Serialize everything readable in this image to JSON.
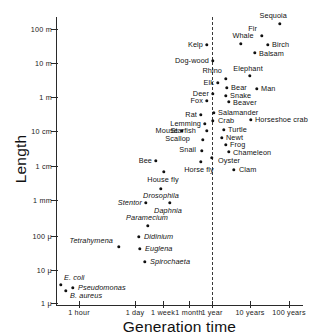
{
  "chart_data": {
    "type": "scatter",
    "title": "",
    "xlabel": "Generation time",
    "ylabel": "Length",
    "xticks": [
      "1 hour",
      "1 day",
      "1 week",
      "1 month",
      "1 year",
      "10 years",
      "100 years"
    ],
    "yticks": [
      "100 m",
      "10 m",
      "1 m",
      "10 cm",
      "1 cm",
      "1 mm",
      "100 μ",
      "10 μ",
      "1 μ"
    ],
    "grid": false,
    "legend": "none",
    "annotations": [
      {
        "name": "one-year-divider",
        "type": "vertical-dashed-line",
        "x": "1 year"
      }
    ],
    "points": [
      {
        "label": "Sequoia",
        "x": 280,
        "y": 24,
        "lx": 287,
        "ly": 16,
        "align": "r",
        "italic": false
      },
      {
        "label": "Fir",
        "x": 262,
        "y": 36,
        "lx": 257,
        "ly": 29,
        "align": "r",
        "italic": false
      },
      {
        "label": "Whale",
        "x": 241,
        "y": 44,
        "lx": 243,
        "ly": 36,
        "align": "c",
        "italic": false
      },
      {
        "label": "Birch",
        "x": 268,
        "y": 45,
        "lx": 272,
        "ly": 45,
        "align": "l",
        "italic": false
      },
      {
        "label": "Kelp",
        "x": 207,
        "y": 45,
        "lx": 203,
        "ly": 45,
        "align": "r",
        "italic": false
      },
      {
        "label": "Balsam",
        "x": 255,
        "y": 53,
        "lx": 259,
        "ly": 54,
        "align": "l",
        "italic": false
      },
      {
        "label": "Dog-wood",
        "x": 213,
        "y": 61,
        "lx": 209,
        "ly": 61,
        "align": "r",
        "italic": false
      },
      {
        "label": "Elephant",
        "x": 250,
        "y": 76,
        "lx": 248,
        "ly": 69,
        "align": "c",
        "italic": false
      },
      {
        "label": "Rhino",
        "x": 226,
        "y": 79,
        "lx": 222,
        "ly": 71,
        "align": "r",
        "italic": false
      },
      {
        "label": "Elk",
        "x": 218,
        "y": 83,
        "lx": 214,
        "ly": 83,
        "align": "r",
        "italic": false
      },
      {
        "label": "Bear",
        "x": 227,
        "y": 88,
        "lx": 231,
        "ly": 88,
        "align": "l",
        "italic": false
      },
      {
        "label": "Man",
        "x": 257,
        "y": 89,
        "lx": 261,
        "ly": 89,
        "align": "l",
        "italic": false
      },
      {
        "label": "Deer",
        "x": 213,
        "y": 94,
        "lx": 209,
        "ly": 94,
        "align": "r",
        "italic": false
      },
      {
        "label": "Snake",
        "x": 226,
        "y": 96,
        "lx": 230,
        "ly": 96,
        "align": "l",
        "italic": false
      },
      {
        "label": "Fox",
        "x": 207,
        "y": 101,
        "lx": 203,
        "ly": 101,
        "align": "r",
        "italic": false
      },
      {
        "label": "Beaver",
        "x": 229,
        "y": 102,
        "lx": 233,
        "ly": 103,
        "align": "l",
        "italic": false
      },
      {
        "label": "Salamander",
        "x": 214,
        "y": 113,
        "lx": 218,
        "ly": 113,
        "align": "l",
        "italic": false
      },
      {
        "label": "Rat",
        "x": 201,
        "y": 115,
        "lx": 197,
        "ly": 115,
        "align": "r",
        "italic": false
      },
      {
        "label": "Crab",
        "x": 213,
        "y": 121,
        "lx": 218,
        "ly": 121,
        "align": "l",
        "italic": false
      },
      {
        "label": "Horseshoe crab",
        "x": 251,
        "y": 120,
        "lx": 255,
        "ly": 120,
        "align": "l",
        "italic": false
      },
      {
        "label": "Lemming",
        "x": 205,
        "y": 124,
        "lx": 201,
        "ly": 124,
        "align": "r",
        "italic": false
      },
      {
        "label": "Starfish",
        "x": 207,
        "y": 131,
        "lx": 196,
        "ly": 131,
        "align": "r",
        "italic": false
      },
      {
        "label": "Mouse",
        "x": 182,
        "y": 131,
        "lx": 178,
        "ly": 131,
        "align": "r",
        "italic": false
      },
      {
        "label": "Turtle",
        "x": 224,
        "y": 130,
        "lx": 228,
        "ly": 130,
        "align": "l",
        "italic": false
      },
      {
        "label": "Newt",
        "x": 222,
        "y": 138,
        "lx": 226,
        "ly": 138,
        "align": "l",
        "italic": false
      },
      {
        "label": "Scallop",
        "x": 203,
        "y": 140,
        "lx": 190,
        "ly": 139,
        "align": "r",
        "italic": false
      },
      {
        "label": "Frog",
        "x": 226,
        "y": 145,
        "lx": 230,
        "ly": 145,
        "align": "l",
        "italic": false
      },
      {
        "label": "Snail",
        "x": 202,
        "y": 151,
        "lx": 196,
        "ly": 150,
        "align": "r",
        "italic": false
      },
      {
        "label": "Chameleon",
        "x": 229,
        "y": 152,
        "lx": 233,
        "ly": 153,
        "align": "l",
        "italic": false
      },
      {
        "label": "Oyster",
        "x": 212,
        "y": 158,
        "lx": 218,
        "ly": 161,
        "align": "l",
        "italic": false
      },
      {
        "label": "Bee",
        "x": 156,
        "y": 161,
        "lx": 152,
        "ly": 161,
        "align": "r",
        "italic": false
      },
      {
        "label": "Horse fly",
        "x": 201,
        "y": 162,
        "lx": 199,
        "ly": 170,
        "align": "c",
        "italic": false
      },
      {
        "label": "Clam",
        "x": 234,
        "y": 170,
        "lx": 239,
        "ly": 170,
        "align": "l",
        "italic": false
      },
      {
        "label": "House fly",
        "x": 164,
        "y": 172,
        "lx": 163,
        "ly": 180,
        "align": "c",
        "italic": false
      },
      {
        "label": "Drosophila",
        "x": 161,
        "y": 189,
        "lx": 161,
        "ly": 196,
        "align": "c",
        "italic": true
      },
      {
        "label": "Daphnia",
        "x": 170,
        "y": 203,
        "lx": 168,
        "ly": 211,
        "align": "c",
        "italic": true
      },
      {
        "label": "Stentor",
        "x": 146,
        "y": 203,
        "lx": 142,
        "ly": 203,
        "align": "r",
        "italic": true
      },
      {
        "label": "Paramecium",
        "x": 148,
        "y": 226,
        "lx": 147,
        "ly": 218,
        "align": "c",
        "italic": true
      },
      {
        "label": "Didinium",
        "x": 139,
        "y": 237,
        "lx": 144,
        "ly": 237,
        "align": "l",
        "italic": true
      },
      {
        "label": "Tetrahymena",
        "x": 119,
        "y": 247,
        "lx": 113,
        "ly": 241,
        "align": "r",
        "italic": true
      },
      {
        "label": "Euglena",
        "x": 140,
        "y": 249,
        "lx": 145,
        "ly": 249,
        "align": "l",
        "italic": true
      },
      {
        "label": "Spirochaeta",
        "x": 145,
        "y": 262,
        "lx": 150,
        "ly": 262,
        "align": "l",
        "italic": true
      },
      {
        "label": "E. coli",
        "x": 61,
        "y": 285,
        "lx": 64,
        "ly": 278,
        "align": "l",
        "italic": true
      },
      {
        "label": "Pseudomonas",
        "x": 73,
        "y": 288,
        "lx": 78,
        "ly": 288,
        "align": "l",
        "italic": true
      },
      {
        "label": "B. aureus",
        "x": 66,
        "y": 291,
        "lx": 70,
        "ly": 296,
        "align": "l",
        "italic": true
      }
    ]
  },
  "axes": {
    "y": {
      "title": "Length",
      "ticks": [
        {
          "label": "100 m",
          "py": 29
        },
        {
          "label": "10 m",
          "py": 63
        },
        {
          "label": "1 m",
          "py": 97
        },
        {
          "label": "10 cm",
          "py": 131
        },
        {
          "label": "1 cm",
          "py": 166
        },
        {
          "label": "1 mm",
          "py": 200
        },
        {
          "label": "100 μ",
          "py": 236
        },
        {
          "label": "10 μ",
          "py": 270
        },
        {
          "label": "1 μ",
          "py": 303
        }
      ]
    },
    "x": {
      "title": "Generation time",
      "ticks": [
        {
          "label": "1 hour",
          "px": 79
        },
        {
          "label": "1 day",
          "px": 135
        },
        {
          "label": "1 week",
          "px": 163
        },
        {
          "label": "1 month",
          "px": 189
        },
        {
          "label": "1 year",
          "px": 212
        },
        {
          "label": "10 years",
          "px": 250
        },
        {
          "label": "100 years",
          "px": 289
        }
      ]
    }
  }
}
